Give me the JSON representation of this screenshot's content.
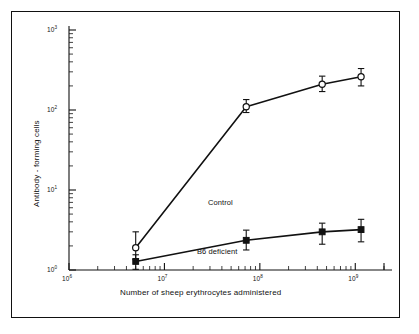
{
  "chart_data": {
    "type": "line",
    "title": "",
    "xlabel": "Number of sheep erythrocytes administered",
    "ylabel": "Antibody - forming cells",
    "xscale": "log",
    "yscale": "log",
    "xlim": [
      1000000,
      2000000000
    ],
    "ylim": [
      1,
      1000
    ],
    "grid": false,
    "legend_position": "inline-annotation",
    "xticks": [
      {
        "value": 1000000,
        "label": "10",
        "exp": "6"
      },
      {
        "value": 10000000,
        "label": "10",
        "exp": "7"
      },
      {
        "value": 100000000,
        "label": "10",
        "exp": "8"
      },
      {
        "value": 1000000000,
        "label": "10",
        "exp": "9"
      }
    ],
    "yticks": [
      {
        "value": 1,
        "label": "10",
        "exp": "0"
      },
      {
        "value": 10,
        "label": "10",
        "exp": "1"
      },
      {
        "value": 100,
        "label": "10",
        "exp": "2"
      },
      {
        "value": 1000,
        "label": "10",
        "exp": "3"
      }
    ],
    "series": [
      {
        "name": "Control",
        "marker": "open-circle",
        "x": [
          5000000,
          72000000,
          450000000,
          1150000000
        ],
        "values": [
          1.9,
          110,
          210,
          260
        ],
        "error_low": [
          1.35,
          93,
          170,
          200
        ],
        "error_high": [
          3.0,
          135,
          265,
          330
        ],
        "label_position": {
          "x": 196,
          "y": 186
        }
      },
      {
        "name": "B6 deficient",
        "marker": "filled-square",
        "x": [
          5000000,
          72000000,
          450000000,
          1150000000
        ],
        "values": [
          1.28,
          2.35,
          3.0,
          3.2
        ],
        "error_low": [
          1.02,
          1.78,
          2.1,
          2.25
        ],
        "error_high": [
          1.55,
          3.15,
          3.85,
          4.3
        ],
        "label_position": {
          "x": 185,
          "y": 235
        }
      }
    ]
  },
  "axes": {
    "y_title": "Antibody - forming cells",
    "x_title": "Number of sheep erythrocytes administered"
  }
}
